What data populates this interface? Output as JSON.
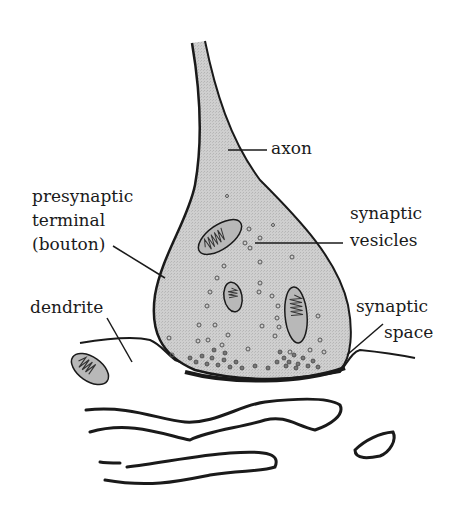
{
  "diagram": {
    "type": "anatomical-illustration",
    "colors": {
      "outline": "#1a1a1a",
      "terminal_fill": "#c9c9c9",
      "vesicle_outline": "#555555",
      "background": "#ffffff"
    },
    "labels": {
      "axon": "axon",
      "presynaptic_line1": "presynaptic",
      "presynaptic_line2": "terminal",
      "presynaptic_line3": "(bouton)",
      "vesicles_line1": "synaptic",
      "vesicles_line2": "vesicles",
      "dendrite": "dendrite",
      "space_line1": "synaptic",
      "space_line2": "space"
    }
  }
}
